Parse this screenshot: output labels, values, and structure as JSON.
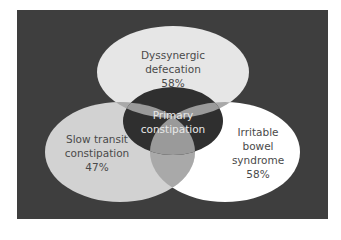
{
  "diagram": {
    "type": "venn",
    "colors": {
      "background": "#3e3e3e",
      "top_circle": "#e6e6e6",
      "left_circle": "#d2d2d2",
      "right_circle": "#ffffff",
      "overlap": "#a9a9a9",
      "center": "#2f2f2f"
    },
    "sets": [
      {
        "id": "top",
        "lines": [
          "Dyssynergic",
          "defecation",
          "58%"
        ]
      },
      {
        "id": "left",
        "lines": [
          "Slow transit",
          "constipation",
          "47%"
        ]
      },
      {
        "id": "right",
        "lines": [
          "Irritable",
          "bowel",
          "syndrome",
          "58%"
        ]
      }
    ],
    "center": {
      "lines": [
        "Primary",
        "constipation"
      ]
    }
  }
}
